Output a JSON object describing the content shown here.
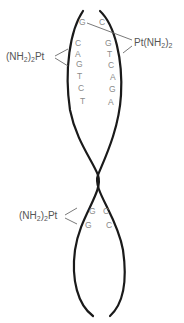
{
  "diagram": {
    "type": "cisplatin-DNA crosslink schematic",
    "colors": {
      "strand": "#1a1a1a",
      "base_text": "#8a8a8a",
      "label_text": "#555555",
      "bond_line": "#6a6a6a"
    },
    "top_pair": {
      "left": "G",
      "right": "C"
    },
    "left_column": [
      "C",
      "A",
      "G",
      "T",
      "C",
      "T"
    ],
    "right_column": [
      "G",
      "T",
      "C",
      "A",
      "G",
      "A"
    ],
    "bottom_pairs": [
      {
        "left": "G",
        "right": "C"
      },
      {
        "left": "G",
        "right": "C"
      }
    ],
    "labels": {
      "interstrand_pt": {
        "main": "Pt(NH",
        "sub": "2",
        "close": ")",
        "sub2": "2"
      },
      "intrastrand_pt_upper": {
        "open": "(NH",
        "sub": "2",
        "close": ")",
        "sub2": "2",
        "main": "Pt"
      },
      "intrastrand_pt_lower": {
        "open": "(NH",
        "sub": "2",
        "close": ")",
        "sub2": "2",
        "main": "Pt"
      }
    }
  }
}
